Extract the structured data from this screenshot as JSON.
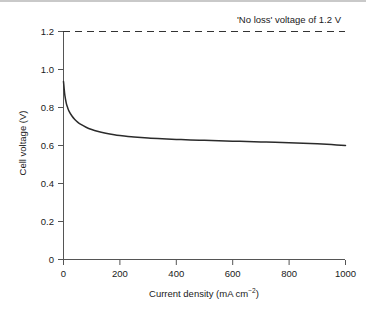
{
  "chart_data": {
    "type": "line",
    "title": "",
    "xlabel": "Current density (mA cm⁻²)",
    "xlabel_base": "Current density (mA cm",
    "xlabel_sup": "−2",
    "xlabel_tail": ")",
    "ylabel": "Cell voltage (V)",
    "xlim": [
      0,
      1000
    ],
    "ylim": [
      0,
      1.2
    ],
    "xticks": [
      0,
      200,
      400,
      600,
      800,
      1000
    ],
    "xtick_labels": [
      "0",
      "200",
      "400",
      "600",
      "800",
      "1000"
    ],
    "yticks": [
      0,
      0.2,
      0.4,
      0.6,
      0.8,
      1.0,
      1.2
    ],
    "ytick_labels": [
      "0",
      "0.2",
      "0.4",
      "0.6",
      "0.8",
      "1.0",
      "1.2"
    ],
    "grid": false,
    "legend": null,
    "annotations": [
      {
        "text": "'No loss' voltage of 1.2 V",
        "x": 640,
        "y": 1.2,
        "placement": "above-right"
      }
    ],
    "reference_lines": [
      {
        "name": "no-loss-voltage",
        "orientation": "horizontal",
        "value": 1.2,
        "style": "dashed",
        "color": "#333333",
        "label": "'No loss' voltage of 1.2 V"
      }
    ],
    "series": [
      {
        "name": "Cell voltage",
        "color": "#2b2b2b",
        "style": "solid",
        "x": [
          0,
          2,
          5,
          10,
          15,
          20,
          30,
          40,
          50,
          60,
          80,
          100,
          120,
          150,
          180,
          200,
          250,
          300,
          350,
          400,
          450,
          500,
          550,
          600,
          650,
          700,
          750,
          800,
          850,
          900,
          950,
          1000
        ],
        "values": [
          0.937,
          0.905,
          0.862,
          0.822,
          0.798,
          0.78,
          0.755,
          0.737,
          0.723,
          0.712,
          0.696,
          0.684,
          0.675,
          0.665,
          0.657,
          0.653,
          0.645,
          0.639,
          0.635,
          0.632,
          0.629,
          0.627,
          0.625,
          0.623,
          0.621,
          0.619,
          0.617,
          0.614,
          0.612,
          0.609,
          0.605,
          0.6
        ]
      }
    ]
  },
  "figure": {
    "background": "#ffffff",
    "axis_color": "#555555",
    "text_color": "#1a1a1a"
  }
}
